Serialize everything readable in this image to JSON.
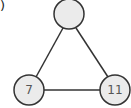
{
  "figure_label": ")",
  "graph": {
    "nodes": [
      {
        "id": "top",
        "label": "",
        "cx": 69,
        "cy": 14,
        "r": 15
      },
      {
        "id": "left",
        "label": "7",
        "cx": 29,
        "cy": 90,
        "r": 15
      },
      {
        "id": "right",
        "label": "11",
        "cx": 115,
        "cy": 90,
        "r": 15
      }
    ],
    "edges": [
      [
        "top",
        "left"
      ],
      [
        "top",
        "right"
      ],
      [
        "left",
        "right"
      ]
    ]
  },
  "colors": {
    "node_fill": "#ebebeb",
    "stroke": "#333333",
    "text": "#555555"
  }
}
